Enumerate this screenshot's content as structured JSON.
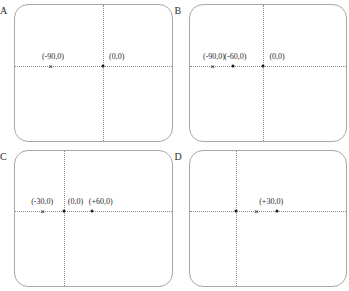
{
  "figure": {
    "layout": "2x2 grid of coordinate panels",
    "background_color": "#ffffff",
    "border_color": "#a8a8a8",
    "axis_color": "#8d8d8d",
    "marker_color": "#1a1a1a"
  },
  "panels": [
    {
      "letter": "A",
      "origin_x_pct": 56,
      "origin_y_pct": 45,
      "points": [
        {
          "label": "(-90,0)",
          "marker": "cross",
          "x_pct": 23,
          "y_pct": 45,
          "label_dx": 2,
          "label_dy": -5
        },
        {
          "label": "(0,0)",
          "marker": "dot",
          "x_pct": 56,
          "y_pct": 45,
          "label_dx": 14,
          "label_dy": -5
        }
      ]
    },
    {
      "letter": "B",
      "origin_x_pct": 47,
      "origin_y_pct": 45,
      "points": [
        {
          "label": "(-90,0)",
          "marker": "cross",
          "x_pct": 15,
          "y_pct": 45,
          "label_dx": 1,
          "label_dy": -5
        },
        {
          "label": "(-60,0)",
          "marker": "dot",
          "x_pct": 28,
          "y_pct": 45,
          "label_dx": 2,
          "label_dy": -5
        },
        {
          "label": "(0,0)",
          "marker": "dot",
          "x_pct": 47,
          "y_pct": 45,
          "label_dx": 14,
          "label_dy": -5
        }
      ]
    },
    {
      "letter": "C",
      "origin_x_pct": 31,
      "origin_y_pct": 45,
      "points": [
        {
          "label": "(-30,0)",
          "marker": "cross",
          "x_pct": 18,
          "y_pct": 45,
          "label_dx": -1,
          "label_dy": -5
        },
        {
          "label": "(0,0)",
          "marker": "dot",
          "x_pct": 31,
          "y_pct": 45,
          "label_dx": 12,
          "label_dy": -5
        },
        {
          "label": "(+60,0)",
          "marker": "dot",
          "x_pct": 49,
          "y_pct": 45,
          "label_dx": 9,
          "label_dy": -5
        }
      ]
    },
    {
      "letter": "D",
      "origin_x_pct": 30,
      "origin_y_pct": 45,
      "points": [
        {
          "label": "",
          "marker": "dot",
          "x_pct": 30,
          "y_pct": 45,
          "label_dx": 0,
          "label_dy": -5
        },
        {
          "label": "",
          "marker": "cross",
          "x_pct": 43,
          "y_pct": 45,
          "label_dx": 0,
          "label_dy": -5
        },
        {
          "label": "(+30,0)",
          "marker": "dot",
          "x_pct": 56,
          "y_pct": 45,
          "label_dx": -6,
          "label_dy": -5
        }
      ]
    }
  ]
}
